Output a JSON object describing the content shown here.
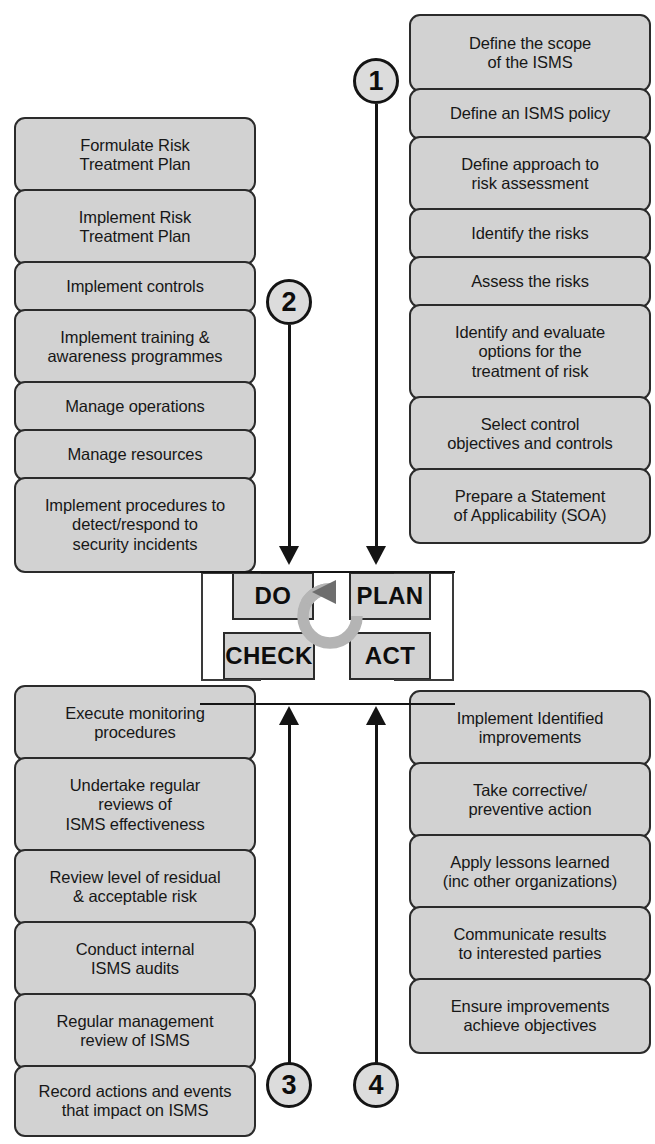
{
  "diagram": {
    "colors": {
      "box_fill": "#d2d2d2",
      "box_border": "#2b2b2b",
      "line": "#141414",
      "cycle_ring": "#b4b4b4",
      "cycle_arrow": "#6e6e6e",
      "text": "#171717"
    }
  },
  "center": {
    "plan_label": "PLAN",
    "do_label": "DO",
    "check_label": "CHECK",
    "act_label": "ACT",
    "cycle_icon": "circular-arrow-icon"
  },
  "markers": [
    {
      "number": "1",
      "name": "marker-1"
    },
    {
      "number": "2",
      "name": "marker-2"
    },
    {
      "number": "3",
      "name": "marker-3"
    },
    {
      "number": "4",
      "name": "marker-4"
    }
  ],
  "plan": {
    "label": "PLAN",
    "items": [
      {
        "text": "Define the scope\nof the ISMS"
      },
      {
        "text": "Define an ISMS policy"
      },
      {
        "text": "Define approach to\nrisk assessment"
      },
      {
        "text": "Identify the risks"
      },
      {
        "text": "Assess the risks"
      },
      {
        "text": "Identify and evaluate\noptions for the\ntreatment of risk"
      },
      {
        "text": "Select control\nobjectives and controls"
      },
      {
        "text": "Prepare a Statement\nof Applicability (SOA)"
      }
    ]
  },
  "do": {
    "label": "DO",
    "items": [
      {
        "text": "Formulate Risk\nTreatment Plan"
      },
      {
        "text": "Implement Risk\nTreatment Plan"
      },
      {
        "text": "Implement controls"
      },
      {
        "text": "Implement training &\nawareness programmes"
      },
      {
        "text": "Manage operations"
      },
      {
        "text": "Manage resources"
      },
      {
        "text": "Implement procedures to\ndetect/respond to\nsecurity incidents"
      }
    ]
  },
  "check": {
    "label": "CHECK",
    "items": [
      {
        "text": "Execute monitoring\nprocedures"
      },
      {
        "text": "Undertake regular\nreviews of\nISMS effectiveness"
      },
      {
        "text": "Review level of residual\n& acceptable risk"
      },
      {
        "text": "Conduct internal\nISMS audits"
      },
      {
        "text": "Regular management\nreview of ISMS"
      },
      {
        "text": "Record actions and events\nthat impact on ISMS"
      }
    ]
  },
  "act": {
    "label": "ACT",
    "items": [
      {
        "text": "Implement Identified\nimprovements"
      },
      {
        "text": "Take corrective/\npreventive action"
      },
      {
        "text": "Apply lessons learned\n(inc other organizations)"
      },
      {
        "text": "Communicate results\nto interested parties"
      },
      {
        "text": "Ensure improvements\nachieve objectives"
      }
    ]
  }
}
